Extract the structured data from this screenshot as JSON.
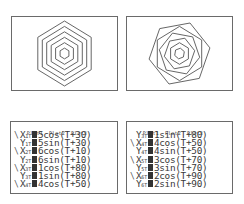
{
  "graphs": [
    {
      "name": "graph-concentric-hexagons",
      "description": "Six concentric hexagons with same orientation",
      "window": {
        "xmin": -9.4,
        "xmax": 9.4,
        "ymin": -6.2,
        "ymax": 6.2
      },
      "tstep_deg": 60,
      "curves": [
        {
          "r": 1,
          "offset": 30
        },
        {
          "r": 2,
          "offset": 30
        },
        {
          "r": 3,
          "offset": 30
        },
        {
          "r": 4,
          "offset": 30
        },
        {
          "r": 5,
          "offset": 30
        },
        {
          "r": 6,
          "offset": 30
        }
      ]
    },
    {
      "name": "graph-rotated-hexagons",
      "description": "Six hexagons with differing rotation offsets",
      "window": {
        "xmin": -9.4,
        "xmax": 9.4,
        "ymin": -6.2,
        "ymax": 6.2
      },
      "tstep_deg": 60,
      "curves": [
        {
          "r": 5,
          "offset": 30
        },
        {
          "r": 6,
          "offset": 10
        },
        {
          "r": 1,
          "offset": 80
        },
        {
          "r": 4,
          "offset": 50
        },
        {
          "r": 3,
          "offset": 70
        },
        {
          "r": 2,
          "offset": 90
        }
      ]
    }
  ],
  "editors": [
    {
      "plots": [
        "Plot1",
        "Plot2",
        "Plot3"
      ],
      "equations": [
        {
          "selected": true,
          "var": "X",
          "sub": "1T",
          "expr": "5cos(T+30)"
        },
        {
          "selected": false,
          "var": "Y",
          "sub": "1T",
          "expr": "5sin(T+30)"
        },
        {
          "selected": true,
          "var": "X",
          "sub": "2T",
          "expr": "6cos(T+10)"
        },
        {
          "selected": false,
          "var": "Y",
          "sub": "2T",
          "expr": "6sin(T+10)"
        },
        {
          "selected": true,
          "var": "X",
          "sub": "3T",
          "expr": "1cos(T+80)"
        },
        {
          "selected": false,
          "var": "Y",
          "sub": "3T",
          "expr": "1sin(T+80)"
        },
        {
          "selected": true,
          "var": "X",
          "sub": "4T",
          "expr": "4cos(T+50)"
        }
      ]
    },
    {
      "plots": [
        "Plot1",
        "Plot2",
        "Plot3"
      ],
      "equations": [
        {
          "selected": false,
          "var": "Y",
          "sub": "3T",
          "expr": "1sin(T+80)"
        },
        {
          "selected": true,
          "var": "X",
          "sub": "4T",
          "expr": "4cos(T+50)"
        },
        {
          "selected": false,
          "var": "Y",
          "sub": "4T",
          "expr": "4sin(T+50)"
        },
        {
          "selected": true,
          "var": "X",
          "sub": "5T",
          "expr": "3cos(T+70)"
        },
        {
          "selected": false,
          "var": "Y",
          "sub": "5T",
          "expr": "3sin(T+70)"
        },
        {
          "selected": true,
          "var": "X",
          "sub": "6T",
          "expr": "2cos(T+90)"
        },
        {
          "selected": false,
          "var": "Y",
          "sub": "6T",
          "expr": "2sin(T+90)"
        }
      ]
    }
  ],
  "colors": {
    "line": "#555555",
    "frame": "#6a6a6a",
    "background": "#ffffff"
  }
}
